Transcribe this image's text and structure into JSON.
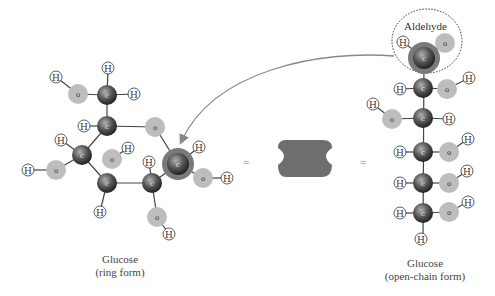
{
  "diagram": {
    "equals_left": "=",
    "equals_right": "=",
    "aldehyde_label": "Aldehyde",
    "ring_caption": {
      "line1": "Glucose",
      "line2": "(ring form)"
    },
    "chain_caption": {
      "line1": "Glucose",
      "line2": "(open-chain form)"
    },
    "atom_labels": {
      "carbon": "c",
      "oxygen": "o",
      "hydrogen": "H"
    },
    "colors": {
      "carbon": "#555555",
      "oxygen": "#bdbdbd",
      "hydrogen_stroke": "#333333",
      "bond": "#444444",
      "arrow": "#888888",
      "symbol_shape": "#6e6e6e",
      "highlight_ring": "#7a7a7a"
    },
    "symbol": "glucose-shape-icon"
  }
}
